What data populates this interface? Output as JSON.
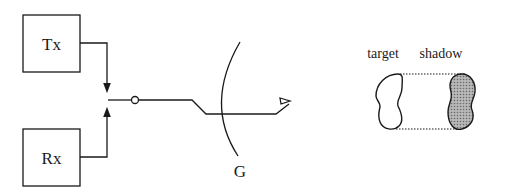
{
  "diagram": {
    "tx_label": "Tx",
    "rx_label": "Rx",
    "ground_label": "G",
    "target_label": "target",
    "shadow_label": "shadow"
  },
  "colors": {
    "stroke": "#1a1a1a",
    "shadow_fill": "#9a9a9a",
    "background": "#ffffff"
  }
}
